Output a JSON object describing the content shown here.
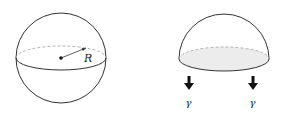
{
  "figure": {
    "sphere": {
      "radius_label": "R",
      "center": [
        61,
        58
      ],
      "radius": 45,
      "equator_ry": 12
    },
    "hemisphere": {
      "center": [
        224,
        59
      ],
      "radius": 45,
      "base_ry": 12,
      "base_fill": "#ececec"
    },
    "arrows": [
      {
        "label": "γ",
        "x": 189
      },
      {
        "label": "γ",
        "x": 253
      }
    ],
    "colors": {
      "stroke": "#333333",
      "dashed": "#aaaaaa",
      "arrow": "#111111"
    }
  }
}
